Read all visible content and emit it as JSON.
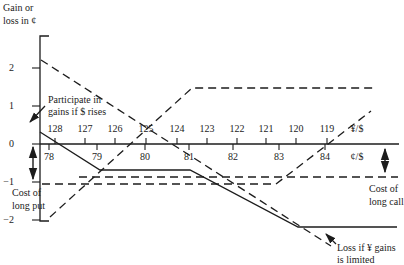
{
  "figure": {
    "background": "#ffffff",
    "ink": "#1c1c1c",
    "width_px": 404,
    "height_px": 265
  },
  "chart_data": {
    "type": "line",
    "title": "",
    "grid": "off",
    "legend": "none",
    "y_axis": {
      "label_lines": [
        "Gain or",
        "loss in ¢"
      ],
      "label_x_px": 3,
      "label_y_px": [
        9,
        22
      ],
      "axis_x_px": 40,
      "top_y_px": 36,
      "bottom_y_px": 221,
      "cap_len_px": 9,
      "ticks": [
        {
          "label": "2",
          "value": 2,
          "y_px": 68
        },
        {
          "label": "1",
          "value": 1,
          "y_px": 106
        },
        {
          "label": "0",
          "value": 0,
          "y_px": 144
        },
        {
          "label": "−1",
          "value": -1,
          "y_px": 182
        },
        {
          "label": "−2",
          "value": -2,
          "y_px": 220
        }
      ],
      "tick_inner_x_px": 32,
      "tick_label_right_x_px": 14
    },
    "x_axis": {
      "y_px": 144,
      "x_start_px": 40,
      "x_end_px": 399,
      "top_scale": {
        "unit_label": "¥/$",
        "unit_label_x_px": 357,
        "label_y_px": 130,
        "tick_len_px": 6,
        "ticks": [
          {
            "label": "128",
            "x_px": 55
          },
          {
            "label": "127",
            "x_px": 85
          },
          {
            "label": "126",
            "x_px": 115
          },
          {
            "label": "125",
            "x_px": 146
          },
          {
            "label": "124",
            "x_px": 177
          },
          {
            "label": "123",
            "x_px": 207
          },
          {
            "label": "122",
            "x_px": 237
          },
          {
            "label": "121",
            "x_px": 266
          },
          {
            "label": "120",
            "x_px": 296
          },
          {
            "label": "119",
            "x_px": 327
          }
        ]
      },
      "bottom_scale": {
        "unit_label": "¢/$",
        "unit_label_x_px": 357,
        "label_y_px": 158,
        "tick_len_px": 6,
        "ticks": [
          {
            "label": "78",
            "x_px": 49
          },
          {
            "label": "79",
            "x_px": 97
          },
          {
            "label": "80",
            "x_px": 145
          },
          {
            "label": "81",
            "x_px": 189
          },
          {
            "label": "82",
            "x_px": 233
          },
          {
            "label": "83",
            "x_px": 279
          },
          {
            "label": "84",
            "x_px": 325
          }
        ]
      }
    },
    "series": [
      {
        "name": "put-premium-level",
        "description": "Dashed horizontal at cost of long put",
        "line_style": "dashed",
        "points_px": [
          [
            42,
            184
          ],
          [
            276,
            184
          ]
        ],
        "values_cents": [
          [
            77.8,
            -1.05
          ],
          [
            82.9,
            -1.05
          ]
        ]
      },
      {
        "name": "call-premium-level",
        "description": "Dashed horizontal at cost of long call",
        "line_style": "dashed",
        "points_px": [
          [
            79,
            177
          ],
          [
            398,
            177
          ]
        ],
        "values_cents": [
          [
            78.7,
            -0.87
          ],
          [
            85.6,
            -0.87
          ]
        ]
      },
      {
        "name": "long-call-payoff-rising",
        "description": "Dashed line rising to upper right, crosses axis at 119 ¥/$ (84 ¢/$)",
        "line_style": "dashed",
        "points_px": [
          [
            276,
            184
          ],
          [
            371,
            111
          ]
        ],
        "values_cents": [
          [
            82.9,
            -1.05
          ],
          [
            85.0,
            0.87
          ]
        ]
      },
      {
        "name": "rising-payoff-with-cap",
        "description": "Dashed payoff rising from lower left, capped flat at +1.5¢",
        "line_style": "dashed",
        "points_px": [
          [
            50,
            217
          ],
          [
            192,
            88
          ],
          [
            373,
            88
          ]
        ],
        "values_cents": [
          [
            78.0,
            -1.92
          ],
          [
            81.1,
            1.47
          ],
          [
            85.0,
            1.47
          ]
        ]
      },
      {
        "name": "unlimited-loss-line",
        "description": "Dashed straight payoff falling across chart — loss if ¥ gains is limited label points to its end",
        "line_style": "dashed",
        "points_px": [
          [
            41,
            60
          ],
          [
            331,
            246
          ]
        ],
        "values_cents": [
          [
            77.8,
            2.2
          ],
          [
            84.2,
            -2.68
          ]
        ]
      },
      {
        "name": "hedged-position",
        "description": "Solid payoff: participates in gains if $ rises, mid floor, then capped loss floor",
        "line_style": "solid",
        "points_px": [
          [
            40,
            132
          ],
          [
            100,
            170
          ],
          [
            190,
            170
          ],
          [
            298,
            227
          ],
          [
            397,
            227
          ]
        ],
        "values_cents": [
          [
            77.8,
            0.32
          ],
          [
            79.1,
            -0.68
          ],
          [
            81.1,
            -0.68
          ],
          [
            83.4,
            -2.18
          ],
          [
            85.6,
            -2.18
          ]
        ]
      }
    ],
    "annotations": [
      {
        "id": "participate",
        "lines": [
          "Participate in",
          "gains if $ rises"
        ],
        "x_px": 48,
        "line_y_px": [
          101,
          113
        ],
        "anchor": "start",
        "arrow": {
          "from": [
            45,
            106
          ],
          "to": [
            30,
            122
          ]
        }
      },
      {
        "id": "cost-long-put",
        "lines": [
          "Cost of",
          "long put"
        ],
        "x_px": 12,
        "line_y_px": [
          194,
          207
        ],
        "anchor": "start",
        "double_arrow": {
          "x": 33,
          "y1": 147,
          "y2": 179
        }
      },
      {
        "id": "cost-long-call",
        "lines": [
          "Cost of",
          "long call"
        ],
        "x_px": 369,
        "line_y_px": [
          190,
          203
        ],
        "anchor": "start",
        "double_arrow": {
          "x": 385,
          "y1": 149,
          "y2": 172
        }
      },
      {
        "id": "loss-limited",
        "lines": [
          "Loss if ¥ gains",
          "is limited"
        ],
        "x_px": 337,
        "line_y_px": [
          249,
          261
        ],
        "anchor": "start",
        "arrow": {
          "from": [
            336,
            244
          ],
          "to": [
            326,
            234
          ]
        }
      }
    ]
  }
}
